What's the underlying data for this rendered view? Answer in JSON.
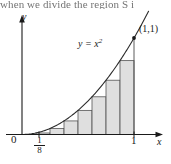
{
  "figure": {
    "caption_fragment": "when we divide the region S i",
    "axes": {
      "y_label": "y",
      "x_label": "x",
      "origin_label": "0"
    },
    "ticks": {
      "first_partition_numerator": "1",
      "first_partition_denominator": "8",
      "right_endpoint": "1"
    },
    "curve_label_base": "y = x",
    "curve_label_exponent": "2",
    "point_label": "(1,1)",
    "colors": {
      "ink": "#1a1a1a",
      "curve": "#2b2b2b",
      "bar_fill": "#d9d9d9",
      "bar_stroke": "#555555",
      "background": "#ffffff"
    }
  },
  "chart_data": {
    "type": "area",
    "title": "",
    "xlabel": "x",
    "ylabel": "y",
    "xlim": [
      0,
      1.22
    ],
    "ylim": [
      0,
      1.18
    ],
    "grid": false,
    "legend": "none",
    "function": "y = x^2",
    "curve": {
      "x": [
        0,
        0.125,
        0.25,
        0.375,
        0.5,
        0.625,
        0.75,
        0.875,
        1.0
      ],
      "y": [
        0,
        0.015625,
        0.0625,
        0.140625,
        0.25,
        0.390625,
        0.5625,
        0.765625,
        1.0
      ]
    },
    "annotations": [
      {
        "text": "(1,1)",
        "x": 1.0,
        "y": 1.0
      },
      {
        "text": "y = x^2",
        "x": 0.62,
        "y": 0.78
      }
    ],
    "tick_labels": {
      "x": [
        "0",
        "1/8",
        "1"
      ],
      "y": []
    },
    "rectangles": {
      "note": "8 inscribed (left-endpoint) rectangles of width 1/8 under y = x^2 on [0,1]",
      "n": 8,
      "width": 0.125,
      "left_edges": [
        0,
        0.125,
        0.25,
        0.375,
        0.5,
        0.625,
        0.75,
        0.875
      ],
      "heights": [
        0,
        0.015625,
        0.0625,
        0.140625,
        0.25,
        0.390625,
        0.5625,
        0.765625
      ]
    }
  }
}
